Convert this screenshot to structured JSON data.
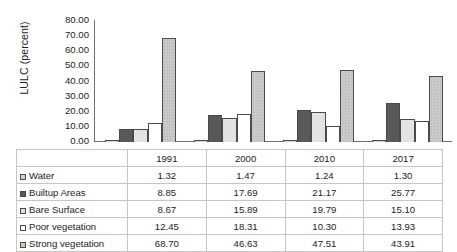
{
  "chart_data": {
    "type": "bar",
    "title": "",
    "xlabel": "",
    "ylabel": "LULC (percent)",
    "ylim": [
      0,
      80
    ],
    "ytick_step": 10,
    "grid": false,
    "legend_position": "table-below",
    "categories": [
      "1991",
      "2000",
      "2010",
      "2017"
    ],
    "ytick_labels": [
      "80.00",
      "70.00",
      "60.00",
      "50.00",
      "40.00",
      "30.00",
      "20.00",
      "10.00",
      "0.00"
    ],
    "series": [
      {
        "name": "Water",
        "values": [
          1.32,
          1.47,
          1.24,
          1.3
        ],
        "labels": [
          "1.32",
          "1.47",
          "1.24",
          "1.30"
        ],
        "color": "#d2d2d2",
        "swatch": "s0"
      },
      {
        "name": "Builtup Areas",
        "values": [
          8.85,
          17.69,
          21.17,
          25.77
        ],
        "labels": [
          "8.85",
          "17.69",
          "21.17",
          "25.77"
        ],
        "color": "#595959",
        "swatch": "s1"
      },
      {
        "name": "Bare Surface",
        "values": [
          8.67,
          15.89,
          19.79,
          15.1
        ],
        "labels": [
          "8.67",
          "15.89",
          "19.79",
          "15.10"
        ],
        "color": "#e2e2e2",
        "swatch": "s2"
      },
      {
        "name": "Poor vegetation",
        "values": [
          12.45,
          18.31,
          10.3,
          13.93
        ],
        "labels": [
          "12.45",
          "18.31",
          "10.30",
          "13.93"
        ],
        "color": "#ffffff",
        "swatch": "s3"
      },
      {
        "name": "Strong vegetation",
        "values": [
          68.7,
          46.63,
          47.51,
          43.91
        ],
        "labels": [
          "68.70",
          "46.63",
          "47.51",
          "43.91"
        ],
        "color": "#c9c9c9",
        "swatch": "s4"
      }
    ]
  }
}
